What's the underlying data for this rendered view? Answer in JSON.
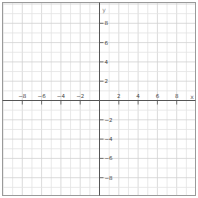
{
  "chart_data": {
    "type": "line",
    "title": "",
    "xlabel": "x",
    "ylabel": "y",
    "xlim": [
      -10,
      10
    ],
    "ylim": [
      -10,
      10
    ],
    "grid": true,
    "grid_step": 1,
    "x_ticks": [
      -8,
      -6,
      -4,
      -2,
      2,
      4,
      6,
      8
    ],
    "y_ticks": [
      8,
      6,
      4,
      2,
      -2,
      -4,
      -6,
      -8
    ],
    "x_tick_labels": [
      "−8",
      "−6",
      "−4",
      "−2",
      "2",
      "4",
      "6",
      "8"
    ],
    "y_tick_labels": [
      "8",
      "6",
      "4",
      "2",
      "−2",
      "−4",
      "−6",
      "−8"
    ],
    "series": []
  },
  "colors": {
    "background": "#ffffff",
    "grid": "#e3e3e3",
    "grid_major": "#d2d2d2",
    "axis": "#555555",
    "frame": "#999999",
    "label": "#444444"
  }
}
